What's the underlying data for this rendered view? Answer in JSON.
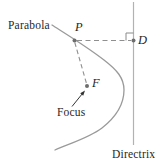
{
  "diagram": {
    "type": "geometry-diagram",
    "labels": {
      "parabola": "Parabola",
      "focus": "Focus",
      "directrix": "Directrix",
      "point_p": "P",
      "point_d": "D",
      "point_f": "F"
    },
    "relations": {
      "dashed_segment_1": "P to D (perpendicular to directrix, right-angle mark at D)",
      "dashed_segment_2": "P to F",
      "arrow": "Focus label points to F"
    },
    "colors": {
      "curve": "#9a9a9a",
      "directrix_line": "#b2b2b2",
      "dashed_line": "#8f8f8f",
      "marker": "#8a8a8a",
      "point_dot": "#6e6e6e",
      "arrow": "#333333",
      "text": "#1f1f1f",
      "background": "#ffffff"
    }
  }
}
